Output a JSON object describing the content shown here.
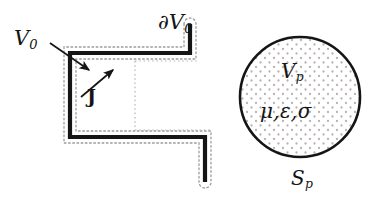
{
  "figure": {
    "kind": "electromagnetics-scattering-geometry-diagram",
    "background_color": "#ffffff",
    "ink_color": "#151515",
    "dot_fill_color": "#b9b2b2",
    "dotted_boundary_color": "#9a9a9a"
  },
  "labels": {
    "source_region": {
      "base": "V",
      "sub": "0",
      "text": "V0"
    },
    "source_boundary": {
      "base": "∂V",
      "sub": "0",
      "text": "∂V0"
    },
    "current_density": {
      "text": "J"
    },
    "particle_volume": {
      "base": "V",
      "sub": "p",
      "text": "Vp"
    },
    "material_parameters": {
      "text": "μ,ε,σ"
    },
    "particle_surface": {
      "base": "S",
      "sub": "p",
      "text": "Sp"
    }
  },
  "shapes": {
    "source_polyline": {
      "name": "zigzag-source-region",
      "stroke_width": 4,
      "points": [
        [
          190,
          24
        ],
        [
          190,
          53
        ],
        [
          70,
          53
        ],
        [
          70,
          137
        ],
        [
          205,
          137
        ],
        [
          205,
          182
        ]
      ]
    },
    "dotted_boundary": {
      "name": "dotted-offset-outline",
      "offset": 6,
      "dash": "1.6 2.6"
    },
    "inner_dotted_edges": [
      {
        "name": "inner-dotted-vertical",
        "x": 135,
        "y1": 62,
        "y2": 128
      },
      {
        "name": "inner-dotted-horizontal-top",
        "x1": 135,
        "x2": 196,
        "y": 62
      },
      {
        "name": "inner-dotted-horizontal-bottom",
        "x1": 135,
        "x2": 211,
        "y": 128
      }
    ],
    "particle_circle": {
      "name": "particle",
      "cx": 300,
      "cy": 97,
      "r": 60,
      "stroke_width": 2.6
    },
    "leader_arrow": {
      "name": "v0-leader-arrow",
      "from": [
        50,
        43
      ],
      "to": [
        93,
        73
      ]
    },
    "current_arrow": {
      "name": "current-density-arrow",
      "from": [
        82,
        96
      ],
      "to": [
        116,
        68
      ]
    }
  }
}
